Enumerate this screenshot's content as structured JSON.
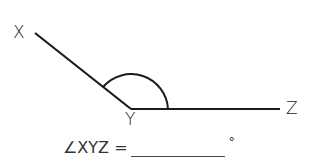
{
  "diagram": {
    "type": "angle",
    "points": {
      "X": {
        "label": "X",
        "x": 35,
        "y": 33
      },
      "Y": {
        "label": "Y",
        "x": 131,
        "y": 109
      },
      "Z": {
        "label": "Z",
        "x": 280,
        "y": 109
      }
    },
    "angle_marked": "XYZ",
    "arc_style": "obtuse",
    "stroke_color": "#1a1a1a"
  },
  "labels": {
    "x": "X",
    "y": "Y",
    "z": "Z"
  },
  "question": {
    "prefix": "∠XYZ =",
    "answer": "",
    "suffix": "°"
  }
}
